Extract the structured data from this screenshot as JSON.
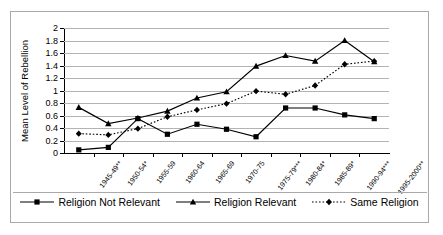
{
  "chart_data": {
    "type": "line",
    "title": "",
    "subtitle": "",
    "xlabel": "",
    "ylabel": "Mean Level of Rebellion",
    "ylim": [
      0,
      2
    ],
    "ytick_step": 0.2,
    "grid": true,
    "legend_position": "bottom",
    "categories": [
      "1945-49**",
      "1950-54*",
      "1955-59",
      "1960-64",
      "1965-69",
      "1970-75",
      "1975-79***",
      "1980-84*",
      "1985-89*",
      "1990-94***",
      "1995-2000**"
    ],
    "ytick_labels": [
      "0",
      "0.2",
      "0.4",
      "0.6",
      "0.8",
      "1",
      "1.2",
      "1.4",
      "1.6",
      "1.8",
      "2"
    ],
    "series": [
      {
        "name": "Religion Not Relevant",
        "marker": "square",
        "line_style": "solid",
        "color": "#000000",
        "values": [
          0.05,
          0.09,
          0.55,
          0.3,
          0.46,
          0.38,
          0.26,
          0.72,
          0.72,
          0.61,
          0.55
        ]
      },
      {
        "name": "Religion Relevant",
        "marker": "triangle",
        "line_style": "solid",
        "color": "#000000",
        "values": [
          0.73,
          0.47,
          0.56,
          0.67,
          0.88,
          0.98,
          1.39,
          1.56,
          1.47,
          1.8,
          1.46
        ]
      },
      {
        "name": "Same Religion",
        "marker": "diamond",
        "line_style": "dotted",
        "color": "#000000",
        "values": [
          0.31,
          0.29,
          0.39,
          0.58,
          0.69,
          0.79,
          0.99,
          0.94,
          1.08,
          1.42,
          1.47
        ]
      }
    ]
  },
  "legend": {
    "items": [
      {
        "label": "Religion Not Relevant"
      },
      {
        "label": "Religion Relevant"
      },
      {
        "label": "Same Religion"
      }
    ]
  }
}
